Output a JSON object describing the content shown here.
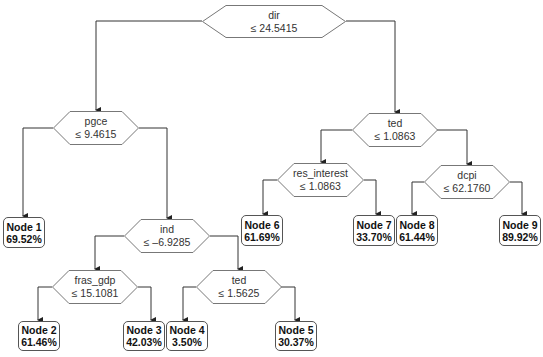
{
  "tree": {
    "decision_nodes": [
      {
        "id": "dir",
        "variable": "dir",
        "condition": "≤ 24.5415"
      },
      {
        "id": "pgce",
        "variable": "pgce",
        "condition": "≤ 9.4615"
      },
      {
        "id": "ted1",
        "variable": "ted",
        "condition": "≤ 1.0863"
      },
      {
        "id": "ind",
        "variable": "ind",
        "condition": "≤ –6.9285"
      },
      {
        "id": "res_interest",
        "variable": "res_interest",
        "condition": "≤ 1.0863"
      },
      {
        "id": "dcpi",
        "variable": "dcpi",
        "condition": "≤ 62.1760"
      },
      {
        "id": "fras_gdp",
        "variable": "fras_gdp",
        "condition": "≤ 15.1081"
      },
      {
        "id": "ted2",
        "variable": "ted",
        "condition": "≤ 1.5625"
      }
    ],
    "leaf_nodes": [
      {
        "label": "Node 1",
        "value": "69.52%"
      },
      {
        "label": "Node 2",
        "value": "61.46%"
      },
      {
        "label": "Node 3",
        "value": "42.03%"
      },
      {
        "label": "Node 4",
        "value": "3.50%"
      },
      {
        "label": "Node 5",
        "value": "30.37%"
      },
      {
        "label": "Node 6",
        "value": "61.69%"
      },
      {
        "label": "Node 7",
        "value": "33.70%"
      },
      {
        "label": "Node 8",
        "value": "61.44%"
      },
      {
        "label": "Node 9",
        "value": "89.92%"
      }
    ]
  },
  "colors": {
    "line": "#333333",
    "shape_border": "#777777",
    "background": "#ffffff"
  }
}
